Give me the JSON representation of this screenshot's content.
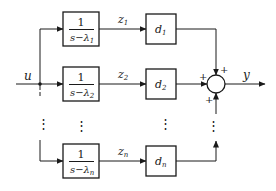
{
  "diagram": {
    "type": "block-diagram",
    "input": {
      "label": "u"
    },
    "output": {
      "label": "y"
    },
    "rows": [
      {
        "tf": {
          "numerator": "1",
          "denominator": "s−λ",
          "sub": "1"
        },
        "signal": {
          "label": "z",
          "sub": "1"
        },
        "gain": {
          "label": "d",
          "sub": "1"
        },
        "sign": "+"
      },
      {
        "tf": {
          "numerator": "1",
          "denominator": "s−λ",
          "sub": "2"
        },
        "signal": {
          "label": "z",
          "sub": "2"
        },
        "gain": {
          "label": "d",
          "sub": "2"
        },
        "sign": "+"
      },
      {
        "tf": {
          "numerator": "1",
          "denominator": "s−λ",
          "sub": "n"
        },
        "signal": {
          "label": "z",
          "sub": "n"
        },
        "gain": {
          "label": "d",
          "sub": "n"
        },
        "sign": "+"
      }
    ],
    "ellipsis": "⋮",
    "summing_junction": {
      "signs": [
        "+",
        "+",
        "+"
      ]
    }
  }
}
